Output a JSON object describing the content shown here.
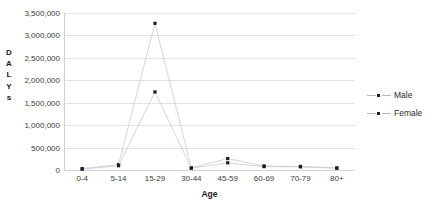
{
  "chart_data": {
    "type": "line",
    "title": "",
    "xlabel": "Age",
    "ylabel": "DALYs",
    "categories": [
      "0-4",
      "5-14",
      "15-29",
      "30-44",
      "45-59",
      "60-69",
      "70-79",
      "80+"
    ],
    "series": [
      {
        "name": "Male",
        "values": [
          30000,
          120000,
          3270000,
          50000,
          255000,
          90000,
          80000,
          45000
        ],
        "marker": "square",
        "line_color": "#c9c9cd",
        "marker_color": "#1a1a2e"
      },
      {
        "name": "Female",
        "values": [
          20000,
          95000,
          1740000,
          40000,
          160000,
          75000,
          70000,
          40000
        ],
        "marker": "square",
        "line_color": "#c9c9cd",
        "marker_color": "#1a1a2e"
      }
    ],
    "ylim": [
      0,
      3500000
    ],
    "ytick_values": [
      3500000,
      3000000,
      2500000,
      2000000,
      1500000,
      1000000,
      500000,
      0
    ],
    "ytick_labels": [
      "3,500,000",
      "3,000,000",
      "2,500,000",
      "2,000,000",
      "1,500,000",
      "1,000,000",
      "500,000",
      "0"
    ],
    "grid": true,
    "legend_position": "right"
  },
  "axis": {
    "y_title_letters": [
      "D",
      "A",
      "L",
      "Y",
      "s"
    ],
    "x_title": "Age"
  },
  "legend": {
    "entries": [
      {
        "label": "Male"
      },
      {
        "label": "Female"
      }
    ]
  }
}
